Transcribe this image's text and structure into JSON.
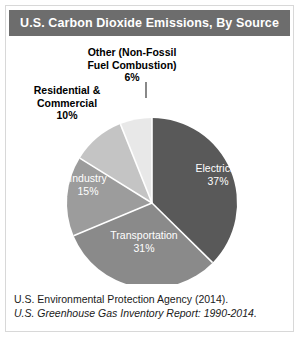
{
  "figure": {
    "title": "U.S. Carbon Dioxide Emissions, By Source",
    "title_bar_color": "#6d6d6d",
    "background": "#ffffff",
    "border_color": "#d8d8d8"
  },
  "footer": {
    "line1": "U.S. Environmental Protection Agency (2014).",
    "line2": "U.S. Greenhouse Gas Inventory Report: 1990-2014."
  },
  "labels": {
    "other_name_line1": "Other (Non-Fossil",
    "other_name_line2": "Fuel Combustion)",
    "other_value": "6%",
    "rescom_name_line1": "Residential &",
    "rescom_name_line2": "Commercial",
    "rescom_value": "10%",
    "electricity_name": "Electricity",
    "electricity_value": "37%",
    "industry_name": "Industry",
    "industry_value": "15%",
    "transportation_name": "Transportation",
    "transportation_value": "31%"
  },
  "chart_data": {
    "type": "pie",
    "title": "U.S. Carbon Dioxide Emissions, By Source",
    "xlabel": "",
    "ylabel": "",
    "units": "percent of total U.S. CO2 emissions",
    "legend": "none (labels drawn on and around slices)",
    "start_angle_deg": 0,
    "direction": "clockwise",
    "categories": [
      "Electricity",
      "Transportation",
      "Industry",
      "Residential & Commercial",
      "Other (Non-Fossil Fuel Combustion)"
    ],
    "values": [
      37,
      31,
      15,
      10,
      6
    ],
    "value_labels": [
      "37%",
      "31%",
      "15%",
      "10%",
      "6%"
    ],
    "colors": [
      "#595959",
      "#8a8a8a",
      "#9c9c9c",
      "#c4c4c4",
      "#e8e8e8"
    ],
    "label_placement": [
      "inside",
      "inside",
      "inside",
      "outside",
      "outside"
    ],
    "slice_label_color_inside": "#ffffff",
    "slice_label_color_outside": "#000000",
    "total": 99,
    "annotations": [
      "U.S. Environmental Protection Agency (2014).",
      "U.S. Greenhouse Gas Inventory Report: 1990-2014."
    ]
  }
}
